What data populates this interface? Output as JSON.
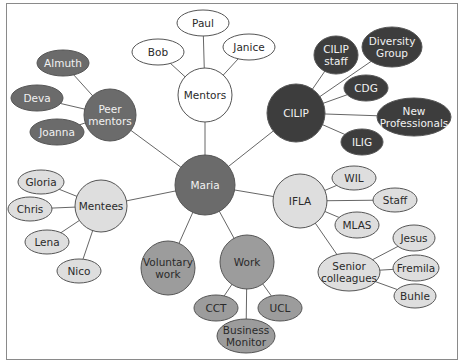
{
  "diagram": {
    "type": "mind-map",
    "center": {
      "id": "maria",
      "label": "Maria"
    },
    "palette": {
      "dark": "#3d3d3d",
      "mid_dark": "#6b6b6b",
      "mid": "#9c9c9c",
      "light": "#dedede",
      "white": "#ffffff",
      "stroke": "#555555",
      "edge": "#666666",
      "text_light": "#f2f2f2",
      "text_dark": "#2a2a2a"
    },
    "nodes": [
      {
        "id": "maria",
        "label": [
          "Maria"
        ],
        "shape": "circle",
        "cx": 205,
        "cy": 185,
        "rx": 30,
        "ry": 30,
        "tone": "mid_dark"
      },
      {
        "id": "mentors",
        "label": [
          "Mentors"
        ],
        "shape": "circle",
        "cx": 205,
        "cy": 95,
        "rx": 27,
        "ry": 27,
        "tone": "white"
      },
      {
        "id": "paul",
        "label": [
          "Paul"
        ],
        "shape": "ellipse",
        "cx": 203,
        "cy": 23,
        "rx": 26,
        "ry": 13,
        "tone": "white"
      },
      {
        "id": "bob",
        "label": [
          "Bob"
        ],
        "shape": "ellipse",
        "cx": 158,
        "cy": 52,
        "rx": 26,
        "ry": 13,
        "tone": "white"
      },
      {
        "id": "janice",
        "label": [
          "Janice"
        ],
        "shape": "ellipse",
        "cx": 249,
        "cy": 47,
        "rx": 26,
        "ry": 13,
        "tone": "white"
      },
      {
        "id": "peer",
        "label": [
          "Peer",
          "mentors"
        ],
        "shape": "circle",
        "cx": 110,
        "cy": 115,
        "rx": 26,
        "ry": 26,
        "tone": "mid_dark"
      },
      {
        "id": "almuth",
        "label": [
          "Almuth"
        ],
        "shape": "ellipse",
        "cx": 63,
        "cy": 63,
        "rx": 26,
        "ry": 13,
        "tone": "mid_dark"
      },
      {
        "id": "deva",
        "label": [
          "Deva"
        ],
        "shape": "ellipse",
        "cx": 37,
        "cy": 98,
        "rx": 26,
        "ry": 13,
        "tone": "mid_dark"
      },
      {
        "id": "joanna",
        "label": [
          "Joanna"
        ],
        "shape": "ellipse",
        "cx": 57,
        "cy": 132,
        "rx": 27,
        "ry": 13,
        "tone": "mid_dark"
      },
      {
        "id": "cilip",
        "label": [
          "CILIP"
        ],
        "shape": "circle",
        "cx": 296,
        "cy": 113,
        "rx": 29,
        "ry": 29,
        "tone": "dark"
      },
      {
        "id": "cilipstaff",
        "label": [
          "CILIP",
          "staff"
        ],
        "shape": "ellipse",
        "cx": 336,
        "cy": 55,
        "rx": 22,
        "ry": 19,
        "tone": "dark"
      },
      {
        "id": "diversity",
        "label": [
          "Diversity",
          "Group"
        ],
        "shape": "ellipse",
        "cx": 392,
        "cy": 47,
        "rx": 30,
        "ry": 20,
        "tone": "dark"
      },
      {
        "id": "cdg",
        "label": [
          "CDG"
        ],
        "shape": "ellipse",
        "cx": 366,
        "cy": 88,
        "rx": 22,
        "ry": 13,
        "tone": "dark"
      },
      {
        "id": "newpro",
        "label": [
          "New",
          "Professionals"
        ],
        "shape": "ellipse",
        "cx": 414,
        "cy": 117,
        "rx": 37,
        "ry": 19,
        "tone": "dark"
      },
      {
        "id": "ilig",
        "label": [
          "ILIG"
        ],
        "shape": "ellipse",
        "cx": 362,
        "cy": 142,
        "rx": 21,
        "ry": 13,
        "tone": "dark"
      },
      {
        "id": "mentees",
        "label": [
          "Mentees"
        ],
        "shape": "circle",
        "cx": 101,
        "cy": 206,
        "rx": 26,
        "ry": 26,
        "tone": "light"
      },
      {
        "id": "gloria",
        "label": [
          "Gloria"
        ],
        "shape": "ellipse",
        "cx": 41,
        "cy": 182,
        "rx": 23,
        "ry": 12,
        "tone": "light"
      },
      {
        "id": "chris",
        "label": [
          "Chris"
        ],
        "shape": "ellipse",
        "cx": 30,
        "cy": 209,
        "rx": 22,
        "ry": 12,
        "tone": "light"
      },
      {
        "id": "lena",
        "label": [
          "Lena"
        ],
        "shape": "ellipse",
        "cx": 47,
        "cy": 242,
        "rx": 22,
        "ry": 12,
        "tone": "light"
      },
      {
        "id": "nico",
        "label": [
          "Nico"
        ],
        "shape": "ellipse",
        "cx": 79,
        "cy": 271,
        "rx": 22,
        "ry": 12,
        "tone": "light"
      },
      {
        "id": "voluntary",
        "label": [
          "Voluntary",
          "work"
        ],
        "shape": "circle",
        "cx": 168,
        "cy": 268,
        "rx": 27,
        "ry": 27,
        "tone": "mid"
      },
      {
        "id": "work",
        "label": [
          "Work"
        ],
        "shape": "circle",
        "cx": 247,
        "cy": 262,
        "rx": 27,
        "ry": 27,
        "tone": "mid"
      },
      {
        "id": "cct",
        "label": [
          "CCT"
        ],
        "shape": "ellipse",
        "cx": 216,
        "cy": 308,
        "rx": 22,
        "ry": 13,
        "tone": "mid"
      },
      {
        "id": "ucl",
        "label": [
          "UCL"
        ],
        "shape": "ellipse",
        "cx": 280,
        "cy": 308,
        "rx": 22,
        "ry": 13,
        "tone": "mid"
      },
      {
        "id": "bizmon",
        "label": [
          "Business",
          "Monitor"
        ],
        "shape": "ellipse",
        "cx": 246,
        "cy": 336,
        "rx": 29,
        "ry": 17,
        "tone": "mid"
      },
      {
        "id": "ifla",
        "label": [
          "IFLA"
        ],
        "shape": "circle",
        "cx": 300,
        "cy": 201,
        "rx": 27,
        "ry": 27,
        "tone": "light"
      },
      {
        "id": "wil",
        "label": [
          "WIL"
        ],
        "shape": "ellipse",
        "cx": 354,
        "cy": 178,
        "rx": 22,
        "ry": 12,
        "tone": "light"
      },
      {
        "id": "staff",
        "label": [
          "Staff"
        ],
        "shape": "ellipse",
        "cx": 395,
        "cy": 200,
        "rx": 22,
        "ry": 12,
        "tone": "light"
      },
      {
        "id": "mlas",
        "label": [
          "MLAS"
        ],
        "shape": "ellipse",
        "cx": 357,
        "cy": 225,
        "rx": 22,
        "ry": 13,
        "tone": "light"
      },
      {
        "id": "senior",
        "label": [
          "Senior",
          "colleagues"
        ],
        "shape": "ellipse",
        "cx": 349,
        "cy": 272,
        "rx": 31,
        "ry": 19,
        "tone": "light"
      },
      {
        "id": "jesus",
        "label": [
          "Jesus"
        ],
        "shape": "ellipse",
        "cx": 414,
        "cy": 238,
        "rx": 21,
        "ry": 13,
        "tone": "light"
      },
      {
        "id": "fremila",
        "label": [
          "Fremila"
        ],
        "shape": "ellipse",
        "cx": 416,
        "cy": 268,
        "rx": 23,
        "ry": 13,
        "tone": "light"
      },
      {
        "id": "buhle",
        "label": [
          "Buhle"
        ],
        "shape": "ellipse",
        "cx": 415,
        "cy": 296,
        "rx": 21,
        "ry": 12,
        "tone": "light"
      }
    ],
    "edges": [
      [
        "maria",
        "mentors"
      ],
      [
        "maria",
        "peer"
      ],
      [
        "maria",
        "cilip"
      ],
      [
        "maria",
        "mentees"
      ],
      [
        "maria",
        "voluntary"
      ],
      [
        "maria",
        "work"
      ],
      [
        "maria",
        "ifla"
      ],
      [
        "mentors",
        "paul"
      ],
      [
        "mentors",
        "bob"
      ],
      [
        "mentors",
        "janice"
      ],
      [
        "peer",
        "almuth"
      ],
      [
        "peer",
        "deva"
      ],
      [
        "peer",
        "joanna"
      ],
      [
        "cilip",
        "cilipstaff"
      ],
      [
        "cilip",
        "diversity"
      ],
      [
        "cilip",
        "cdg"
      ],
      [
        "cilip",
        "newpro"
      ],
      [
        "cilip",
        "ilig"
      ],
      [
        "mentees",
        "gloria"
      ],
      [
        "mentees",
        "chris"
      ],
      [
        "mentees",
        "lena"
      ],
      [
        "mentees",
        "nico"
      ],
      [
        "work",
        "cct"
      ],
      [
        "work",
        "ucl"
      ],
      [
        "work",
        "bizmon"
      ],
      [
        "ifla",
        "wil"
      ],
      [
        "ifla",
        "staff"
      ],
      [
        "ifla",
        "mlas"
      ],
      [
        "ifla",
        "senior"
      ],
      [
        "senior",
        "jesus"
      ],
      [
        "senior",
        "fremila"
      ],
      [
        "senior",
        "buhle"
      ]
    ]
  }
}
